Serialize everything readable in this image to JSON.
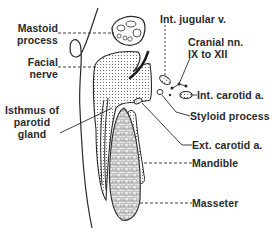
{
  "diagram": {
    "colors": {
      "ink": "#2a2a2a",
      "background": "#ffffff",
      "stipple": "#555555"
    },
    "labels": {
      "mastoid_process": [
        "Mastoid",
        "process"
      ],
      "facial_nerve": [
        "Facial",
        "nerve"
      ],
      "isthmus_parotid": [
        "Isthmus of",
        "parotid",
        "gland"
      ],
      "int_jugular": "Int. jugular v.",
      "cranial_nerves": [
        "Cranial nn.",
        "IX to XII"
      ],
      "int_carotid": "Int. carotid a.",
      "styloid_process": "Styloid process",
      "ext_carotid": "Ext. carotid a.",
      "mandible": "Mandible",
      "masseter": "Masseter"
    }
  }
}
